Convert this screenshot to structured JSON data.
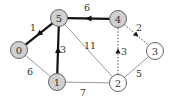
{
  "diagram": {
    "type": "weighted-graph",
    "colors": {
      "tree_edge": "#111111",
      "plain_edge": "#9a9a9a",
      "candidate_edge": "#444444",
      "visited_fill": "#d0d0d0",
      "unvisited_fill": "#ffffff",
      "node_stroke": "#555555",
      "text": "#333333"
    },
    "nodes": [
      {
        "id": "0",
        "label": "0",
        "x": 19,
        "y": 50,
        "visited": true
      },
      {
        "id": "1",
        "label": "1",
        "x": 57,
        "y": 82,
        "visited": true
      },
      {
        "id": "2",
        "label": "2",
        "x": 118,
        "y": 83,
        "visited": false
      },
      {
        "id": "3",
        "label": "3",
        "x": 155,
        "y": 51,
        "visited": false
      },
      {
        "id": "4",
        "label": "4",
        "x": 118,
        "y": 19,
        "visited": true
      },
      {
        "id": "5",
        "label": "5",
        "x": 59,
        "y": 18,
        "visited": true
      }
    ],
    "edges": [
      {
        "from": "5",
        "to": "0",
        "weight": "1",
        "style": "tree",
        "directed": true,
        "label_x": 33,
        "label_y": 31
      },
      {
        "from": "4",
        "to": "5",
        "weight": "6",
        "style": "tree",
        "directed": true,
        "label_x": 87,
        "label_y": 11
      },
      {
        "from": "1",
        "to": "5",
        "weight": "3",
        "style": "tree",
        "directed": true,
        "label_x": 63,
        "label_y": 53
      },
      {
        "from": "4",
        "to": "3",
        "weight": "2",
        "style": "candidate",
        "directed": true,
        "label_x": 139,
        "label_y": 31
      },
      {
        "from": "2",
        "to": "4",
        "weight": "3",
        "style": "candidate",
        "directed": true,
        "label_x": 124,
        "label_y": 55
      },
      {
        "from": "5",
        "to": "2",
        "weight": "11",
        "style": "plain",
        "directed": false,
        "label_x": 90,
        "label_y": 49
      },
      {
        "from": "0",
        "to": "1",
        "weight": "6",
        "style": "plain",
        "directed": false,
        "label_x": 30,
        "label_y": 75
      },
      {
        "from": "1",
        "to": "2",
        "weight": "7",
        "style": "plain",
        "directed": false,
        "label_x": 83,
        "label_y": 96
      },
      {
        "from": "2",
        "to": "3",
        "weight": "5",
        "style": "plain",
        "directed": false,
        "label_x": 139,
        "label_y": 77
      }
    ]
  }
}
